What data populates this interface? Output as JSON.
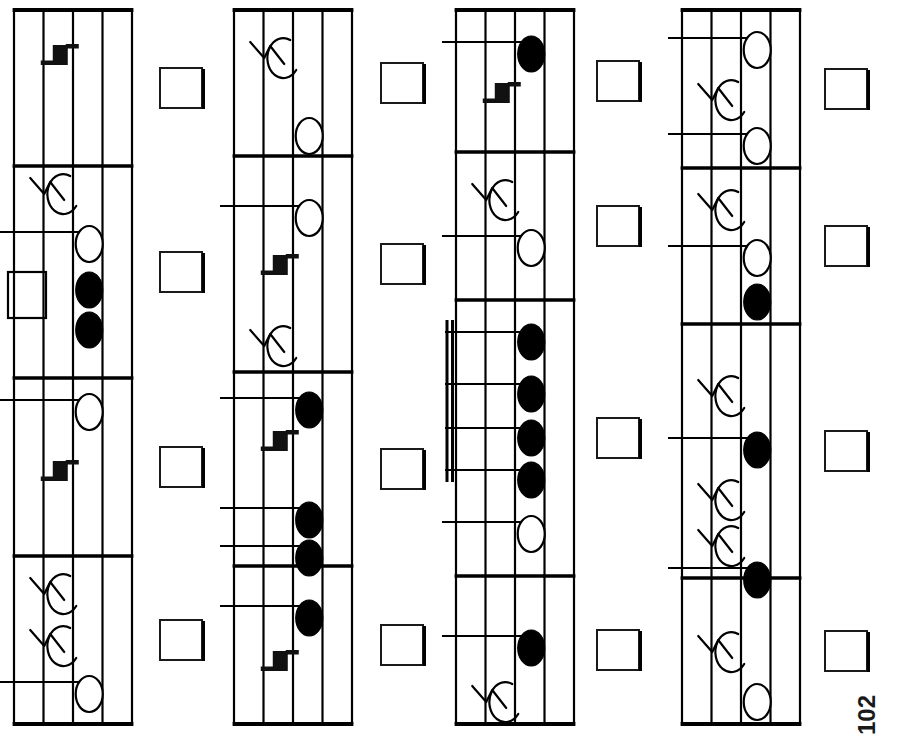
{
  "page": {
    "number": "102",
    "orientation": "rotated-90-ccw",
    "background_color": "#ffffff",
    "ink_color": "#000000",
    "width": 897,
    "height": 749
  },
  "layout": {
    "system_count": 4,
    "measures_per_system": 4,
    "answer_box_per_measure": 1,
    "staff_lines": 5,
    "answer_box": {
      "width": 42,
      "height": 40,
      "fill": "#ffffff",
      "stroke": "#1a1a1a"
    },
    "systems_x": [
      14,
      234,
      456,
      682
    ],
    "system_width": 118,
    "system_top": 10,
    "system_bottom": 724,
    "answer_box_x": [
      160,
      381,
      597,
      825
    ]
  },
  "glyphs": {
    "quarter_rest": "quarter-rest",
    "eighth_rest": "eighth-rest",
    "half_note": "half-note-open",
    "quarter_note": "quarter-note-filled",
    "whole_rest": "whole-rest-block",
    "beam_group": "beamed-sixteenth-group",
    "barline": "barline",
    "ledger_line": "ledger-line"
  },
  "chart_data": {
    "type": "table",
    "systems": [
      {
        "index": 1,
        "measures": [
          {
            "index": 1,
            "bar_start": 10,
            "bar_end": 166,
            "items": [
              {
                "kind": "quarter-rest",
                "pos": 62
              }
            ]
          },
          {
            "index": 2,
            "bar_start": 166,
            "bar_end": 378,
            "items": [
              {
                "kind": "eighth-rest",
                "pos": 178
              },
              {
                "kind": "half-note-open",
                "pos": 232,
                "ledger": true
              },
              {
                "kind": "whole-rest-block",
                "pos": 272
              },
              {
                "kind": "quarter-note-filled",
                "pos": 278
              },
              {
                "kind": "quarter-note-filled",
                "pos": 318
              }
            ]
          },
          {
            "index": 3,
            "bar_start": 378,
            "bar_end": 556,
            "items": [
              {
                "kind": "half-note-open",
                "pos": 400,
                "ledger": true
              },
              {
                "kind": "quarter-rest",
                "pos": 478
              }
            ]
          },
          {
            "index": 4,
            "bar_start": 556,
            "bar_end": 724,
            "items": [
              {
                "kind": "eighth-rest",
                "pos": 578
              },
              {
                "kind": "eighth-rest",
                "pos": 630
              },
              {
                "kind": "half-note-open",
                "pos": 682,
                "ledger": true
              }
            ]
          }
        ]
      },
      {
        "index": 2,
        "measures": [
          {
            "index": 1,
            "bar_start": 10,
            "bar_end": 156,
            "items": [
              {
                "kind": "eighth-rest",
                "pos": 42
              },
              {
                "kind": "half-note-open",
                "pos": 124
              }
            ]
          },
          {
            "index": 2,
            "bar_start": 156,
            "bar_end": 372,
            "items": [
              {
                "kind": "half-note-open",
                "pos": 206,
                "ledger": true
              },
              {
                "kind": "quarter-rest",
                "pos": 272
              },
              {
                "kind": "eighth-rest",
                "pos": 330
              }
            ]
          },
          {
            "index": 3,
            "bar_start": 372,
            "bar_end": 566,
            "items": [
              {
                "kind": "quarter-note-filled",
                "pos": 398,
                "ledger": true
              },
              {
                "kind": "quarter-rest",
                "pos": 448
              },
              {
                "kind": "quarter-note-filled",
                "pos": 508,
                "ledger": true
              },
              {
                "kind": "quarter-note-filled",
                "pos": 546,
                "ledger": true
              }
            ]
          },
          {
            "index": 4,
            "bar_start": 566,
            "bar_end": 724,
            "items": [
              {
                "kind": "quarter-note-filled",
                "pos": 606,
                "ledger": true
              },
              {
                "kind": "quarter-rest",
                "pos": 668
              }
            ]
          }
        ]
      },
      {
        "index": 3,
        "measures": [
          {
            "index": 1,
            "bar_start": 10,
            "bar_end": 152,
            "items": [
              {
                "kind": "quarter-note-filled",
                "pos": 42,
                "ledger": true
              },
              {
                "kind": "quarter-rest",
                "pos": 100
              }
            ]
          },
          {
            "index": 2,
            "bar_start": 152,
            "bar_end": 300,
            "items": [
              {
                "kind": "eighth-rest",
                "pos": 184
              },
              {
                "kind": "half-note-open",
                "pos": 236,
                "ledger": true
              }
            ]
          },
          {
            "index": 3,
            "bar_start": 300,
            "bar_end": 576,
            "items": [
              {
                "kind": "beamed-sixteenth-group",
                "pos": 320,
                "count": 4,
                "beams": 2,
                "note_positions": [
                  332,
                  384,
                  428,
                  470
                ]
              },
              {
                "kind": "half-note-open",
                "pos": 522,
                "ledger": true
              }
            ]
          },
          {
            "index": 4,
            "bar_start": 576,
            "bar_end": 724,
            "items": [
              {
                "kind": "quarter-note-filled",
                "pos": 636,
                "ledger": true
              },
              {
                "kind": "eighth-rest",
                "pos": 686
              }
            ]
          }
        ]
      },
      {
        "index": 4,
        "measures": [
          {
            "index": 1,
            "bar_start": 10,
            "bar_end": 168,
            "items": [
              {
                "kind": "half-note-open",
                "pos": 38,
                "ledger": true
              },
              {
                "kind": "eighth-rest",
                "pos": 84
              },
              {
                "kind": "half-note-open",
                "pos": 134,
                "ledger": true
              }
            ]
          },
          {
            "index": 2,
            "bar_start": 168,
            "bar_end": 324,
            "items": [
              {
                "kind": "eighth-rest",
                "pos": 194
              },
              {
                "kind": "half-note-open",
                "pos": 246,
                "ledger": true
              },
              {
                "kind": "quarter-note-filled",
                "pos": 290,
                "ledger": false
              }
            ]
          },
          {
            "index": 3,
            "bar_start": 324,
            "bar_end": 578,
            "items": [
              {
                "kind": "eighth-rest",
                "pos": 380
              },
              {
                "kind": "quarter-note-filled",
                "pos": 438,
                "ledger": true
              },
              {
                "kind": "eighth-rest",
                "pos": 484
              },
              {
                "kind": "eighth-rest",
                "pos": 530
              },
              {
                "kind": "quarter-note-filled",
                "pos": 568,
                "ledger": true
              }
            ]
          },
          {
            "index": 4,
            "bar_start": 578,
            "bar_end": 724,
            "items": [
              {
                "kind": "eighth-rest",
                "pos": 636
              },
              {
                "kind": "half-note-open",
                "pos": 690
              }
            ]
          }
        ]
      }
    ]
  }
}
